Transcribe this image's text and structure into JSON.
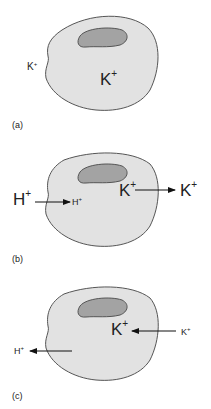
{
  "figure": {
    "colors": {
      "cell_fill": "#e2e2e2",
      "cell_stroke": "#555555",
      "nucleus_fill": "#a3a3a3",
      "text": "#222222",
      "arrow": "#111111"
    },
    "panels": [
      {
        "id": "a",
        "caption": "(a)",
        "labels": {
          "outside_k": "K",
          "outside_k_sup": "+",
          "inside_k": "K",
          "inside_k_sup": "+"
        }
      },
      {
        "id": "b",
        "caption": "(b)",
        "labels": {
          "h_out": "H",
          "h_out_sup": "+",
          "h_in": "H",
          "h_in_sup": "+",
          "k_in": "K",
          "k_in_sup": "+",
          "k_out": "K",
          "k_out_sup": "+"
        },
        "arrows": [
          {
            "name": "h-influx",
            "direction": "into-cell"
          },
          {
            "name": "k-efflux",
            "direction": "out-of-cell"
          }
        ]
      },
      {
        "id": "c",
        "caption": "(c)",
        "labels": {
          "h_out": "H",
          "h_out_sup": "+",
          "k_in": "K",
          "k_in_sup": "+",
          "k_out": "K",
          "k_out_sup": "+"
        },
        "arrows": [
          {
            "name": "h-efflux",
            "direction": "out-of-cell"
          },
          {
            "name": "k-influx",
            "direction": "into-cell"
          }
        ]
      }
    ]
  }
}
